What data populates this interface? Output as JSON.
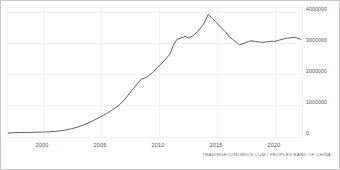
{
  "chart_data": {
    "type": "line",
    "title": "",
    "subtitle": "",
    "xlabel": "",
    "ylabel": "",
    "source": "TRADINGECONOMICS.COM | PEOPLES BANK OF CHINA",
    "grid": true,
    "legend": "none",
    "y_axis_position": "right",
    "xlim": [
      1997.0,
      2022.4
    ],
    "ylim": [
      0,
      4200000
    ],
    "xticks": [
      "2000",
      "2005",
      "2010",
      "2015",
      "2020"
    ],
    "xtick_values": [
      2000,
      2005,
      2010,
      2015,
      2020
    ],
    "yticks": [
      "4000000",
      "3000000",
      "2000000",
      "1000000",
      "0"
    ],
    "ytick_values": [
      4000000,
      3000000,
      2000000,
      1000000,
      0
    ],
    "line_color": "#4d4d4d",
    "series": [
      {
        "name": "Foreign Exchange Reserves",
        "x": [
          1997.0,
          1997.5,
          1998.0,
          1998.5,
          1999.0,
          1999.5,
          2000.0,
          2000.5,
          2001.0,
          2001.5,
          2002.0,
          2002.5,
          2003.0,
          2003.5,
          2004.0,
          2004.5,
          2005.0,
          2005.5,
          2006.0,
          2006.5,
          2007.0,
          2007.5,
          2008.0,
          2008.5,
          2009.0,
          2009.5,
          2010.0,
          2010.5,
          2011.0,
          2011.3,
          2011.6,
          2012.0,
          2012.3,
          2012.6,
          2013.0,
          2013.4,
          2013.8,
          2014.0,
          2014.3,
          2014.6,
          2015.0,
          2015.4,
          2015.8,
          2016.0,
          2016.4,
          2016.8,
          2017.0,
          2017.4,
          2017.8,
          2018.0,
          2018.4,
          2018.8,
          2019.0,
          2019.4,
          2019.8,
          2020.0,
          2020.4,
          2020.8,
          2021.0,
          2021.4,
          2021.8,
          2022.0,
          2022.3
        ],
        "values": [
          130000,
          140000,
          145000,
          148000,
          152000,
          155000,
          160000,
          168000,
          180000,
          200000,
          230000,
          270000,
          320000,
          390000,
          470000,
          560000,
          660000,
          760000,
          880000,
          1010000,
          1180000,
          1420000,
          1650000,
          1880000,
          1950000,
          2100000,
          2300000,
          2480000,
          2700000,
          3000000,
          3180000,
          3230000,
          3280000,
          3220000,
          3300000,
          3440000,
          3620000,
          3750000,
          3990000,
          3880000,
          3730000,
          3560000,
          3420000,
          3300000,
          3180000,
          3050000,
          3000000,
          3050000,
          3110000,
          3130000,
          3110000,
          3090000,
          3080000,
          3100000,
          3120000,
          3110000,
          3150000,
          3190000,
          3210000,
          3230000,
          3250000,
          3220000,
          3180000
        ]
      }
    ]
  }
}
